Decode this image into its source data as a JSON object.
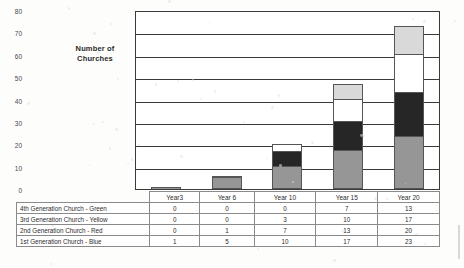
{
  "chart_data": {
    "type": "bar",
    "subtype": "stacked-bar",
    "title": "",
    "xlabel": "",
    "ylabel": "Number of Churches",
    "ylim": [
      0,
      80
    ],
    "yticks": [
      0,
      10,
      20,
      30,
      40,
      50,
      60,
      70,
      80
    ],
    "grid": true,
    "legend_position": "none",
    "categories": [
      "Year3",
      "Year 6",
      "Year 10",
      "Year 15",
      "Year 20"
    ],
    "series": [
      {
        "name": "1st Generation Church - Blue",
        "values": [
          1,
          5,
          10,
          17,
          23
        ],
        "color": "#969696",
        "stack_order": 1
      },
      {
        "name": "2nd Generation Church - Red",
        "values": [
          0,
          1,
          7,
          13,
          20
        ],
        "color": "#262626",
        "stack_order": 2
      },
      {
        "name": "3rd Generation Church - Yellow",
        "values": [
          0,
          0,
          3,
          10,
          17
        ],
        "color": "#ffffff",
        "stack_order": 3
      },
      {
        "name": "4th Generation Church - Green",
        "values": [
          0,
          0,
          0,
          7,
          13
        ],
        "color": "#d9d9d9",
        "stack_order": 4
      }
    ],
    "totals": [
      1,
      6,
      20,
      47,
      73
    ]
  },
  "table": {
    "header": [
      "",
      "Year3",
      "Year 6",
      "Year 10",
      "Year 15",
      "Year 20"
    ],
    "rows": [
      {
        "label": "4th Generation Church - Green",
        "values": [
          "0",
          "0",
          "0",
          "7",
          "13"
        ]
      },
      {
        "label": "3rd Generation Church - Yellow",
        "values": [
          "0",
          "0",
          "3",
          "10",
          "17"
        ]
      },
      {
        "label": "2nd Generation Church - Red",
        "values": [
          "0",
          "1",
          "7",
          "13",
          "20"
        ]
      },
      {
        "label": "1st Generation Church - Blue",
        "values": [
          "1",
          "5",
          "10",
          "17",
          "23"
        ]
      }
    ]
  },
  "axis": {
    "title": "Number of Churches",
    "ticks": [
      "80",
      "70",
      "60",
      "50",
      "40",
      "30",
      "20",
      "10",
      "0"
    ]
  },
  "colors": {
    "blue_series": "#969696",
    "red_series": "#262626",
    "yellow_series": "#ffffff",
    "green_series": "#d9d9d9",
    "axis": "#3a3a3a",
    "background": "#fdfdfc"
  }
}
